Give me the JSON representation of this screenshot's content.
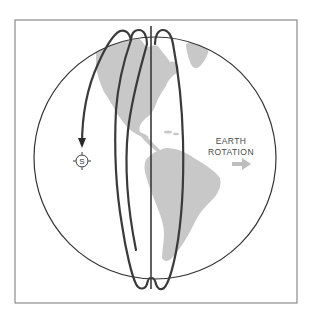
{
  "diagram": {
    "labels": {
      "rotation_line1": "EARTH",
      "rotation_line2": "ROTATION",
      "satellite_symbol": "S"
    },
    "icons": {
      "rotation_arrow": "right-arrow-icon",
      "satellite": "satellite-marker-icon",
      "direction_arrowhead": "down-arrowhead-icon"
    },
    "colors": {
      "background": "#ffffff",
      "frame": "#8a8a8a",
      "globe_outline": "#333333",
      "land": "#c8c8c8",
      "orbit_path": "#3a3a3a",
      "rotation_arrow": "#bdbdbd",
      "text": "#4a4a4a"
    },
    "elements": {
      "frame": {
        "x": 15,
        "y": 20,
        "width": 282,
        "height": 283
      },
      "globe": {
        "cx": 155,
        "cy": 158,
        "r": 121
      },
      "satellite": {
        "cx": 82,
        "cy": 161,
        "r": 6
      }
    }
  }
}
